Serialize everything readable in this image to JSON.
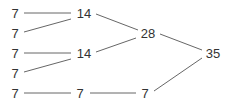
{
  "diagram": {
    "type": "sum-tree",
    "nodes": [
      {
        "id": "a1",
        "label": "7",
        "x": 15,
        "y": 13
      },
      {
        "id": "a2",
        "label": "7",
        "x": 15,
        "y": 33
      },
      {
        "id": "a3",
        "label": "7",
        "x": 15,
        "y": 53
      },
      {
        "id": "a4",
        "label": "7",
        "x": 15,
        "y": 73
      },
      {
        "id": "a5",
        "label": "7",
        "x": 15,
        "y": 93
      },
      {
        "id": "b1",
        "label": "14",
        "x": 84,
        "y": 13
      },
      {
        "id": "b2",
        "label": "14",
        "x": 84,
        "y": 53
      },
      {
        "id": "b3",
        "label": "7",
        "x": 80,
        "y": 93
      },
      {
        "id": "c1",
        "label": "28",
        "x": 148,
        "y": 33
      },
      {
        "id": "c2",
        "label": "7",
        "x": 145,
        "y": 93
      },
      {
        "id": "d1",
        "label": "35",
        "x": 213,
        "y": 53
      }
    ],
    "edges": [
      {
        "from": "a1",
        "to": "b1",
        "x1": 24,
        "y1": 13,
        "x2": 71,
        "y2": 13
      },
      {
        "from": "a2",
        "to": "b1",
        "x1": 24,
        "y1": 32,
        "x2": 71,
        "y2": 19
      },
      {
        "from": "a3",
        "to": "b2",
        "x1": 24,
        "y1": 53,
        "x2": 71,
        "y2": 53
      },
      {
        "from": "a4",
        "to": "b2",
        "x1": 24,
        "y1": 72,
        "x2": 71,
        "y2": 59
      },
      {
        "from": "a5",
        "to": "b3",
        "x1": 24,
        "y1": 93,
        "x2": 71,
        "y2": 93
      },
      {
        "from": "b1",
        "to": "c1",
        "x1": 96,
        "y1": 14,
        "x2": 138,
        "y2": 30
      },
      {
        "from": "b2",
        "to": "c1",
        "x1": 96,
        "y1": 52,
        "x2": 136,
        "y2": 38
      },
      {
        "from": "b3",
        "to": "c2",
        "x1": 90,
        "y1": 93,
        "x2": 136,
        "y2": 93
      },
      {
        "from": "c1",
        "to": "d1",
        "x1": 160,
        "y1": 34,
        "x2": 202,
        "y2": 50
      },
      {
        "from": "c2",
        "to": "d1",
        "x1": 154,
        "y1": 91,
        "x2": 202,
        "y2": 58
      }
    ],
    "line_color": "#555555",
    "text_color": "#333333"
  }
}
